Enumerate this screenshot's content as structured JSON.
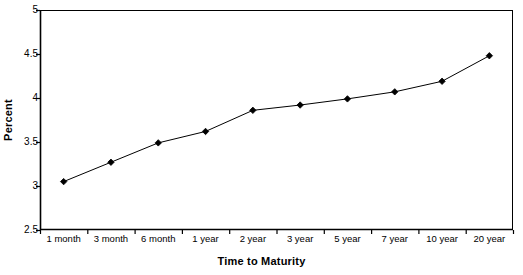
{
  "chart_data": {
    "type": "line",
    "title": "",
    "xlabel": "Time to Maturity",
    "ylabel": "Percent",
    "categories": [
      "1 month",
      "3 month",
      "6 month",
      "1 year",
      "2 year",
      "3 year",
      "5 year",
      "7 year",
      "10 year",
      "20 year"
    ],
    "values": [
      3.05,
      3.27,
      3.49,
      3.62,
      3.86,
      3.92,
      3.99,
      4.07,
      4.19,
      4.48
    ],
    "ylim": [
      2.5,
      5
    ],
    "ytick_labels": [
      "2.5",
      "3",
      "3.5",
      "4",
      "4.5",
      "5"
    ],
    "ytick_values": [
      2.5,
      3,
      3.5,
      4,
      4.5,
      5
    ],
    "grid": false,
    "legend": null,
    "marker": "diamond",
    "series_color": "#000000",
    "axis_color": "#000000",
    "background_color": "#ffffff"
  }
}
